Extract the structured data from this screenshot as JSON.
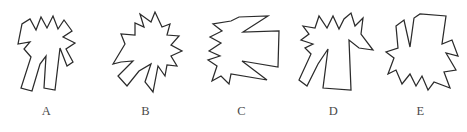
{
  "sheet": {
    "kind": "mental-rotation-figure-set",
    "background_color": "#ffffff",
    "stroke_color": "#2b2b2b",
    "fill_color": "#ffffff",
    "width": 467,
    "height": 132,
    "figure_count": 5
  },
  "figures": [
    {
      "label": "A",
      "description": "Jagged shirt-like polygon, spikes pointing up, two legs below with deep V notch",
      "orientation": "upright",
      "points": "18,40 22,20 30,15 36,26 41,13 47,24 53,12 58,25 64,16 72,27 63,33 75,39 66,45 73,58 67,62 60,44 55,86 44,84 46,52 40,60 32,87 21,84 31,53 24,45 30,38"
    },
    {
      "label": "B",
      "description": "Same jagged polygon rotated clockwise about 30 degrees, long point toward lower right",
      "orientation": "rotated-cw-30",
      "points": "14,60 26,40 22,30 36,31 36,19 45,23 41,10 52,18 56,8 63,23 71,20 68,31 80,32 72,41 83,47 72,52 78,62 68,61 66,72 59,62 54,88 46,78 52,60 40,67 28,82 19,72 34,57 22,58"
    },
    {
      "label": "C",
      "description": "Same jagged polygon rotated about 90 degrees counter-clockwise, teeth pointing left",
      "orientation": "rotated-ccw-90",
      "points": "14,47 26,39 15,33 27,27 18,20 36,17 44,13 73,12 48,28 84,27 83,63 47,57 72,76 36,70 34,80 26,72 17,77 22,62 13,56 25,52"
    },
    {
      "label": "D",
      "description": "Same jagged polygon mirrored, spikes up, right arm extends to lower right",
      "orientation": "mirrored-upright",
      "points": "14,36 22,30 16,22 28,24 32,12 40,24 46,12 52,25 57,15 64,9 68,22 76,14 74,30 86,46 72,44 62,36 64,86 36,84 41,45 31,60 20,82 12,76 24,50 18,44 26,40"
    },
    {
      "label": "E",
      "description": "Same jagged polygon inverted, spikes pointing down, deep narrow notch at top",
      "orientation": "inverted",
      "points": "22,22 30,16 36,43 40,14 46,10 72,12 68,40 78,36 84,52 72,49 82,66 70,68 76,84 60,78 54,86 48,72 42,82 36,70 28,80 22,66 14,70 20,54 12,48 24,44"
    }
  ]
}
